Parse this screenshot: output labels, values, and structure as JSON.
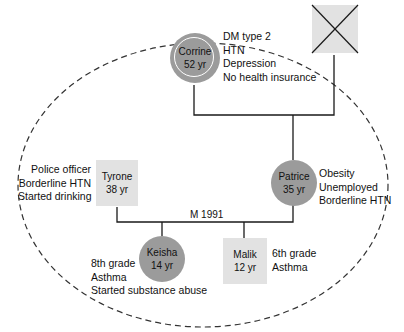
{
  "colors": {
    "male_fill": "#e2e2e2",
    "female_fill": "#9b9b9b",
    "index_ring": "#ffffff",
    "line": "#1a1a1a",
    "boundary": "#333333"
  },
  "people": {
    "grandfather": {
      "name": "",
      "status": "deceased",
      "shape": "square"
    },
    "corrine": {
      "name": "Corrine",
      "age": "52 yr",
      "shape": "circle",
      "notes": [
        "DM type 2",
        "HTN",
        "Depression",
        "No health insurance"
      ]
    },
    "tyrone": {
      "name": "Tyrone",
      "age": "38 yr",
      "shape": "square",
      "notes": [
        "Police officer",
        "Borderline HTN",
        "Started drinking"
      ]
    },
    "patrice": {
      "name": "Patrice",
      "age": "35 yr",
      "shape": "circle",
      "notes": [
        "Obesity",
        "Unemployed",
        "Borderline HTN"
      ]
    },
    "keisha": {
      "name": "Keisha",
      "age": "14 yr",
      "shape": "circle",
      "notes": [
        "8th grade",
        "Asthma",
        "Started substance abuse"
      ]
    },
    "malik": {
      "name": "Malik",
      "age": "12 yr",
      "shape": "square",
      "notes": [
        "6th grade",
        "Asthma"
      ]
    }
  },
  "relationships": {
    "marriage_label": "M 1991"
  }
}
